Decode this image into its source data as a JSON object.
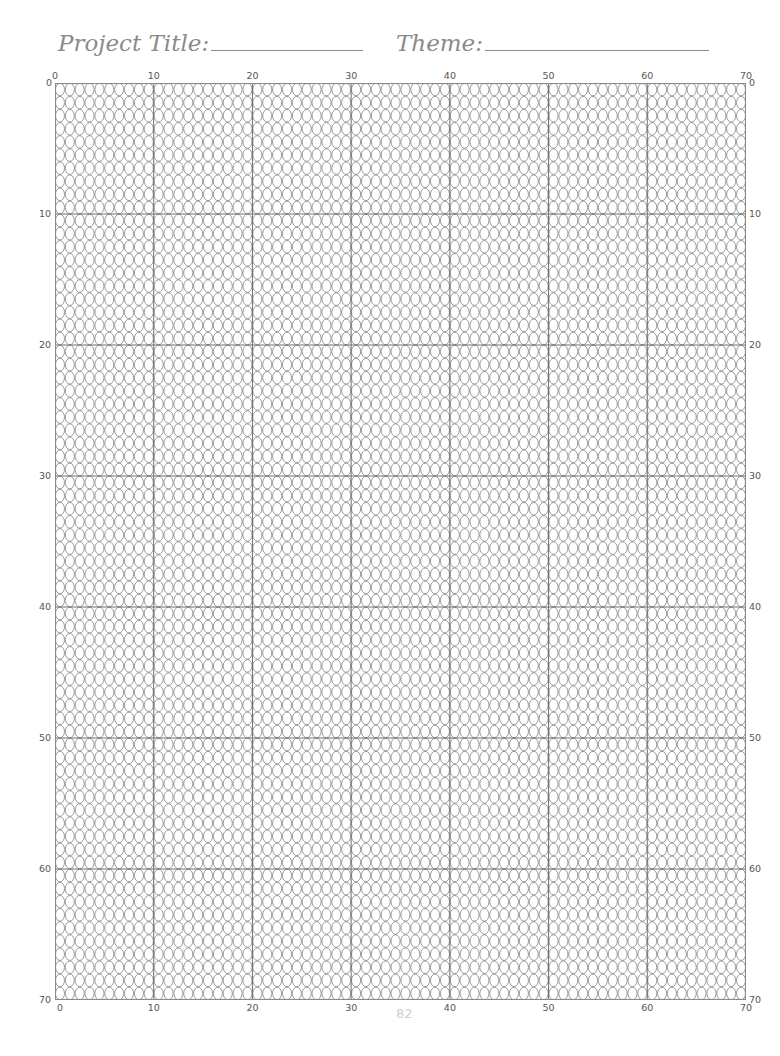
{
  "header": {
    "project_title_label": "Project Title:",
    "theme_label": "Theme:"
  },
  "grid": {
    "columns": 70,
    "rows": 70,
    "cell_shape": "oval",
    "major_every": 10,
    "line_color": "#7a7a7a",
    "major_line_color": "#6f6f6f",
    "top_labels": [
      "0",
      "10",
      "20",
      "30",
      "40",
      "50",
      "60",
      "70"
    ],
    "bottom_labels": [
      "0",
      "10",
      "20",
      "30",
      "40",
      "50",
      "60",
      "70"
    ],
    "left_labels": [
      "0",
      "10",
      "20",
      "30",
      "40",
      "50",
      "60",
      "70"
    ],
    "right_labels": [
      "0",
      "10",
      "20",
      "30",
      "40",
      "50",
      "60",
      "70"
    ]
  },
  "footer": {
    "page_number": "82"
  }
}
